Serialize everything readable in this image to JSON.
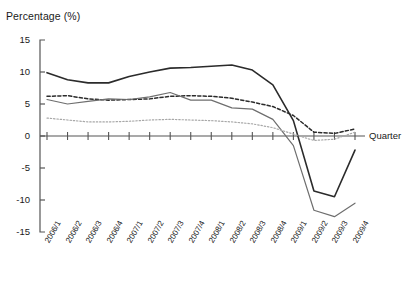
{
  "chart_data": {
    "type": "line",
    "title": "",
    "ylabel": "Percentage (%)",
    "xlabel": "Quarter",
    "ylim": [
      -15,
      15
    ],
    "yticks": [
      15,
      10,
      5,
      0,
      -5,
      -10,
      -15
    ],
    "grid": false,
    "legend": "none",
    "categories": [
      "2006/1",
      "2006/2",
      "2006/3",
      "2006/4",
      "2007/1",
      "2007/2",
      "2007/3",
      "2007/4",
      "2008/1",
      "2008/2",
      "2008/3",
      "2008/4",
      "2009/1",
      "2009/2",
      "2009/3",
      "2009/4"
    ],
    "series": [
      {
        "name": "series-1-solid-dark",
        "style": "solid",
        "color": "#2b2b2b",
        "width": 1.6,
        "values": [
          9.9,
          8.8,
          8.3,
          8.3,
          9.3,
          10.0,
          10.6,
          10.7,
          10.9,
          11.1,
          10.3,
          8.0,
          2.4,
          -8.6,
          -9.5,
          -2.2
        ]
      },
      {
        "name": "series-2-dashed-dark",
        "style": "dashed",
        "color": "#2b2b2b",
        "width": 1.5,
        "values": [
          6.2,
          6.3,
          5.8,
          5.6,
          5.7,
          5.8,
          6.2,
          6.3,
          6.2,
          5.9,
          5.3,
          4.6,
          3.2,
          0.6,
          0.4,
          1.1
        ]
      },
      {
        "name": "series-3-solid-gray",
        "style": "solid",
        "color": "#6e6e6e",
        "width": 1.2,
        "values": [
          5.7,
          5.0,
          5.4,
          5.8,
          5.7,
          6.1,
          6.8,
          5.6,
          5.6,
          4.4,
          4.2,
          2.6,
          -1.5,
          -11.6,
          -12.6,
          -10.5
        ]
      },
      {
        "name": "series-4-dotted-light",
        "style": "dotted",
        "color": "#a8a8a8",
        "width": 1.2,
        "values": [
          2.8,
          2.5,
          2.2,
          2.2,
          2.3,
          2.5,
          2.6,
          2.5,
          2.4,
          2.2,
          1.9,
          1.3,
          0.3,
          -0.7,
          -0.5,
          0.6
        ]
      }
    ]
  },
  "axes": {
    "y_axis_name": "y-axis",
    "x_axis_name": "x-axis"
  }
}
